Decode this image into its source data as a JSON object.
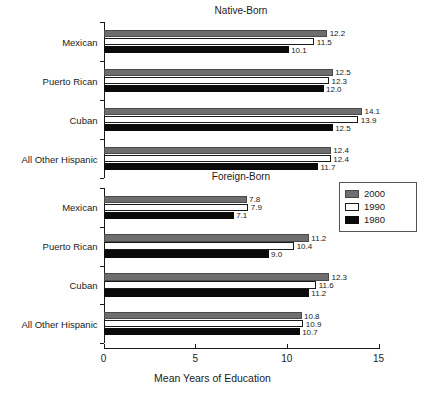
{
  "chart_data": {
    "type": "bar",
    "orientation": "horizontal",
    "title": "",
    "xlabel": "Mean Years of Education",
    "ylabel": "",
    "xlim": [
      0,
      15
    ],
    "xticks": [
      0,
      5,
      10,
      15
    ],
    "xtick_labels": [
      "0",
      "5",
      "10",
      "15"
    ],
    "grid": false,
    "legend_position": "middle-right",
    "legend_entries": [
      "2000",
      "1990",
      "1980"
    ],
    "series_colors": {
      "2000": "#6e6e6e",
      "1990": "#ffffff",
      "1980": "#0a0a0a"
    },
    "panels": [
      {
        "title": "Native-Born",
        "categories": [
          "Mexican",
          "Puerto Rican",
          "Cuban",
          "All Other Hispanic"
        ],
        "series": [
          {
            "name": "2000",
            "values": [
              12.2,
              12.5,
              14.1,
              12.4
            ]
          },
          {
            "name": "1990",
            "values": [
              11.5,
              12.3,
              13.9,
              12.4
            ]
          },
          {
            "name": "1980",
            "values": [
              10.1,
              12.0,
              12.5,
              11.7
            ]
          }
        ],
        "value_labels": [
          [
            "12.2",
            "11.5",
            "10.1"
          ],
          [
            "12.5",
            "12.3",
            "12.0"
          ],
          [
            "14.1",
            "13.9",
            "12.5"
          ],
          [
            "12.4",
            "12.4",
            "11.7"
          ]
        ]
      },
      {
        "title": "Foreign-Born",
        "categories": [
          "Mexican",
          "Puerto Rican",
          "Cuban",
          "All Other Hispanic"
        ],
        "series": [
          {
            "name": "2000",
            "values": [
              7.8,
              11.2,
              12.3,
              10.8
            ]
          },
          {
            "name": "1990",
            "values": [
              7.9,
              10.4,
              11.6,
              10.9
            ]
          },
          {
            "name": "1980",
            "values": [
              7.1,
              9.0,
              11.2,
              10.7
            ]
          }
        ],
        "value_labels": [
          [
            "7.8",
            "7.9",
            "7.1"
          ],
          [
            "11.2",
            "10.4",
            "9.0"
          ],
          [
            "12.3",
            "11.6",
            "11.2"
          ],
          [
            "10.8",
            "10.9",
            "10.7"
          ]
        ]
      }
    ]
  }
}
